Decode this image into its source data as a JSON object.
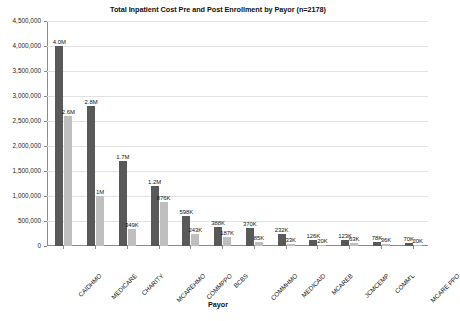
{
  "chart_data": {
    "type": "bar",
    "title": "Total Inpatient Cost Pre and Post Enrollment by Payor (n=2178)",
    "xlabel": "Payor",
    "ylabel": "Cost (dollars)",
    "ylim": [
      0,
      4500000
    ],
    "ytick_labels": [
      "4,500,000",
      "4,000,000",
      "3,500,000",
      "3,000,000",
      "2,500,000",
      "2,000,000",
      "1,500,000",
      "1,000,000",
      "500,000",
      "0"
    ],
    "ytick_values": [
      4500000,
      4000000,
      3500000,
      3000000,
      2500000,
      2000000,
      1500000,
      1000000,
      500000,
      0
    ],
    "grid": true,
    "legend_position": "none",
    "categories": [
      "CAIDHMO",
      "MEDICARE",
      "CHARITY",
      "MCAREHMO",
      "COMMPPO",
      "BCBS",
      "COMMHMO",
      "MEDICAID",
      "MCAREB",
      "JCMCEMP",
      "COMM'L",
      "MCARE PPO"
    ],
    "series": [
      {
        "name": "Pre Enrollment",
        "color": "#595959",
        "values": [
          4000000,
          2800000,
          1700000,
          1200000,
          598000,
          388000,
          370000,
          232000,
          126000,
          123000,
          78000,
          70000
        ],
        "labels": [
          "4.0M",
          "2.8M",
          "1.7M",
          "1.2M",
          "598K",
          "388K",
          "370K",
          "232K",
          "126K",
          "123K",
          "78K",
          "70K"
        ]
      },
      {
        "name": "Post Enrollment",
        "color": "#bfbfbf",
        "values": [
          2600000,
          1000000,
          349000,
          876000,
          243000,
          187000,
          85000,
          33000,
          20000,
          63000,
          36000,
          20000
        ],
        "labels": [
          "2.6M",
          "1M",
          "349K",
          "876K",
          "243K",
          "187K",
          "85K",
          "33K",
          "20K",
          "63K",
          "36K",
          "20K"
        ]
      }
    ]
  }
}
